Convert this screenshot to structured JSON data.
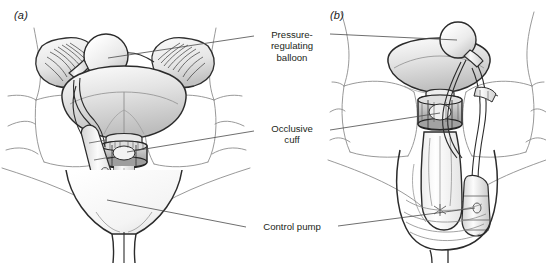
{
  "figure": {
    "width": 546,
    "height": 263,
    "background_color": "#ffffff"
  },
  "panels": [
    {
      "id": "a",
      "label": "(a)",
      "view": "anterior view of bladder, prostate and urethra"
    },
    {
      "id": "b",
      "label": "(b)",
      "view": "anterior view of pelvis, penis and scrotum"
    }
  ],
  "callouts": [
    {
      "id": "balloon",
      "name": "pressure-regulating-balloon",
      "lines": [
        "Pressure-",
        "regulating",
        "balloon"
      ],
      "line1": "Pressure-",
      "line2": "regulating",
      "line3": "balloon"
    },
    {
      "id": "cuff",
      "name": "occlusive-cuff",
      "lines": [
        "Occlusive",
        "cuff"
      ],
      "line1": "Occlusive",
      "line2": "cuff"
    },
    {
      "id": "pump",
      "name": "control-pump",
      "lines": [
        "Control pump"
      ],
      "line1": "Control pump"
    }
  ],
  "colors": {
    "ink": "#231f20",
    "outline_dark": "#2b2b2b",
    "outline_mid": "#555555",
    "outline_light": "#9a9a9a",
    "bone_line": "#8d8d8d",
    "leader_line": "#4a4a4a",
    "tissue_light": "#f2f2f2",
    "tissue_mid": "#d8d8d8",
    "tissue_dark": "#b0b0b0",
    "device_fill": "#ededed",
    "background": "#ffffff"
  }
}
